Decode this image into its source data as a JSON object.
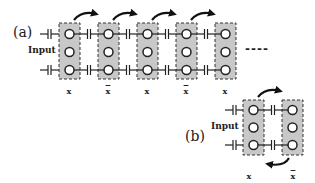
{
  "diagram": {
    "panel_a": {
      "label": "(a)",
      "input_label": "Input",
      "columns": [
        {
          "label": "x",
          "overline": false
        },
        {
          "label": "x",
          "overline": true
        },
        {
          "label": "x",
          "overline": false
        },
        {
          "label": "x",
          "overline": true
        },
        {
          "label": "x",
          "overline": false
        }
      ],
      "nodes_per_column": 3,
      "continuation": "----",
      "arrows": "curved arrows pointing from each column to the next (left to right)"
    },
    "panel_b": {
      "label": "(b)",
      "input_label": "Input",
      "columns": [
        {
          "label": "x",
          "overline": false
        },
        {
          "label": "x",
          "overline": true
        }
      ],
      "nodes_per_column": 3,
      "arrows": "top arrow left-to-right, bottom arrow right-to-left (cycle)"
    },
    "colors": {
      "column_fill": "#c8c8c8",
      "stroke": "#222222",
      "node_fill": "#ffffff"
    }
  }
}
